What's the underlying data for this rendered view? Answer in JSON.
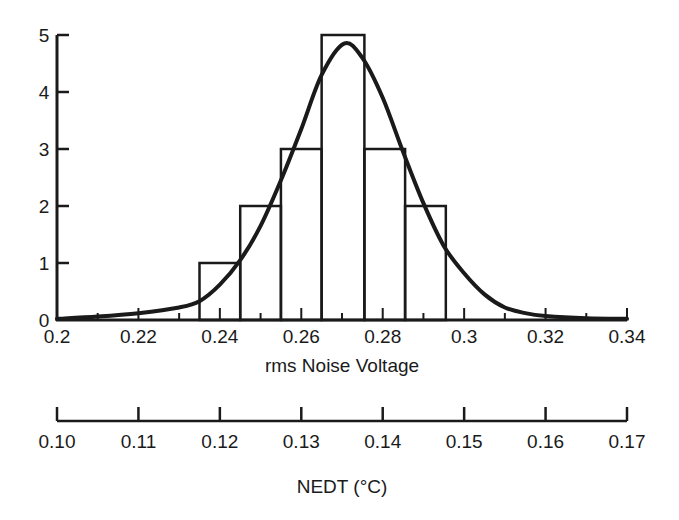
{
  "chart_data": [
    {
      "type": "bar",
      "subtype": "histogram",
      "title": "",
      "xlabel": "rms Noise Voltage",
      "ylabel": "",
      "xlim": [
        0.2,
        0.34
      ],
      "ylim": [
        0,
        5
      ],
      "grid": false,
      "xticks": [
        "0.2",
        "0.22",
        "0.24",
        "0.26",
        "0.28",
        "0.3",
        "0.32",
        "0.34"
      ],
      "xtick_values": [
        0.2,
        0.22,
        0.24,
        0.26,
        0.28,
        0.3,
        0.32,
        0.34
      ],
      "xminor_ticks": [
        0.21,
        0.23,
        0.25,
        0.27,
        0.29,
        0.31,
        0.33
      ],
      "yticks": [
        "0",
        "1",
        "2",
        "3",
        "4",
        "5"
      ],
      "ytick_values": [
        0,
        1,
        2,
        3,
        4,
        5
      ],
      "bins": [
        {
          "start": 0.235,
          "end": 0.245,
          "count": 1
        },
        {
          "start": 0.245,
          "end": 0.255,
          "count": 2
        },
        {
          "start": 0.255,
          "end": 0.265,
          "count": 3
        },
        {
          "start": 0.265,
          "end": 0.2755,
          "count": 5
        },
        {
          "start": 0.2755,
          "end": 0.2855,
          "count": 3
        },
        {
          "start": 0.2855,
          "end": 0.2955,
          "count": 2
        }
      ],
      "fit_curve": {
        "name": "normal fit",
        "x": [
          0.2,
          0.21,
          0.22,
          0.23,
          0.235,
          0.24,
          0.245,
          0.25,
          0.255,
          0.26,
          0.265,
          0.2705,
          0.275,
          0.28,
          0.285,
          0.29,
          0.295,
          0.3,
          0.305,
          0.31,
          0.315,
          0.32,
          0.33,
          0.34
        ],
        "y": [
          0.02,
          0.06,
          0.12,
          0.22,
          0.33,
          0.62,
          1.05,
          1.65,
          2.45,
          3.35,
          4.3,
          4.85,
          4.6,
          3.9,
          2.95,
          2.05,
          1.3,
          0.82,
          0.45,
          0.22,
          0.12,
          0.07,
          0.03,
          0.02
        ]
      }
    },
    {
      "type": "axis",
      "xlabel": "NEDT (°C)",
      "xlim": [
        0.1,
        0.17
      ],
      "xticks": [
        "0.10",
        "0.11",
        "0.12",
        "0.13",
        "0.14",
        "0.15",
        "0.16",
        "0.17"
      ],
      "xtick_values": [
        0.1,
        0.11,
        0.12,
        0.13,
        0.14,
        0.15,
        0.16,
        0.17
      ]
    }
  ]
}
